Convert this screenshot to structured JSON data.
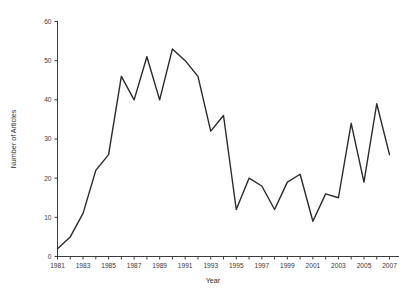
{
  "chart_data": {
    "type": "line",
    "title": "",
    "xlabel": "Year",
    "ylabel": "Number of Articles",
    "x": [
      1981,
      1982,
      1983,
      1984,
      1985,
      1986,
      1987,
      1988,
      1989,
      1990,
      1991,
      1992,
      1993,
      1994,
      1995,
      1996,
      1997,
      1998,
      1999,
      2000,
      2001,
      2002,
      2003,
      2004,
      2005,
      2006,
      2007
    ],
    "values": [
      2,
      5,
      11,
      22,
      26,
      46,
      40,
      51,
      40,
      53,
      50,
      46,
      32,
      36,
      12,
      20,
      18,
      12,
      19,
      21,
      9,
      16,
      15,
      34,
      19,
      39,
      26
    ],
    "series": [
      {
        "name": "Number of Articles",
        "values": [
          2,
          5,
          11,
          22,
          26,
          46,
          40,
          51,
          40,
          53,
          50,
          46,
          32,
          36,
          12,
          20,
          18,
          12,
          19,
          21,
          9,
          16,
          15,
          34,
          19,
          39,
          26
        ]
      }
    ],
    "xlim": [
      1981,
      2007
    ],
    "ylim": [
      0,
      60
    ],
    "ytick_labels": [
      "0",
      "10",
      "20",
      "30",
      "40",
      "50",
      "60"
    ],
    "yticks": [
      0,
      10,
      20,
      30,
      40,
      50,
      60
    ],
    "xtick_labels": [
      "1981",
      "1983",
      "1985",
      "1987",
      "1989",
      "1991",
      "1993",
      "1995",
      "1997",
      "1999",
      "2001",
      "2003",
      "2005",
      "2007"
    ],
    "xticks": [
      1981,
      1983,
      1985,
      1987,
      1989,
      1991,
      1993,
      1995,
      1997,
      1999,
      2001,
      2003,
      2005,
      2007
    ],
    "xticks_minor": [
      1982,
      1984,
      1986,
      1988,
      1990,
      1992,
      1994,
      1996,
      1998,
      2000,
      2002,
      2004,
      2006
    ],
    "grid": false,
    "legend": null,
    "line_color": "#2b2b2b",
    "axis_color": "#3d3d3d",
    "background_color": "#ffffff"
  }
}
